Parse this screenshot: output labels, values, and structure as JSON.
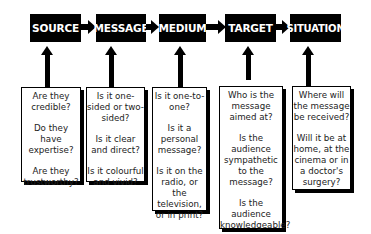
{
  "diagram": {
    "stages": [
      {
        "label": "SOURCE",
        "questions": [
          "Are they credible?",
          "Do they have expertise?",
          "Are they trustworthy?"
        ]
      },
      {
        "label": "MESSAGE",
        "questions": [
          "Is it one-sided or two-sided?",
          "Is it clear and direct?",
          "Is it colourful and vivid?"
        ]
      },
      {
        "label": "MEDIUM",
        "questions": [
          "Is it one-to-one?",
          "Is it a personal message?",
          "Is it on the radio, or the television, or in print?"
        ]
      },
      {
        "label": "TARGET",
        "questions": [
          "Who is the message aimed at?",
          "Is the audience sympathetic to the message?",
          "Is the audience knowledgeable?"
        ]
      },
      {
        "label": "SITUATION",
        "questions": [
          "Where will the message be received?",
          "Will it be at home, at the cinema or in a doctor's surgery?"
        ]
      }
    ],
    "colors": {
      "box_fill": "#000000",
      "box_text": "#ffffff",
      "arrow": "#000000",
      "question_text": "#222222"
    }
  }
}
